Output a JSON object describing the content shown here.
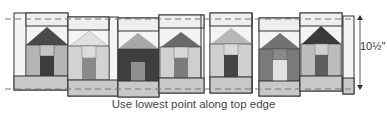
{
  "caption": "Use lowest point along top edge",
  "dimension": {
    "label": "10½\""
  },
  "colors": {
    "outline": "#333333",
    "sky": "#f4f4f4",
    "band": "#dcdcdc",
    "bottom": "#c8c8c8",
    "dash": "#777777"
  },
  "houses": [
    {
      "roof": "#4a4a4a",
      "body": "#b4b4b4",
      "door": "#3c3c3c"
    },
    {
      "roof": "#e0e0e0",
      "body": "#d2d2d2",
      "door": "#8a8a8a"
    },
    {
      "roof": "#a8a8a8",
      "body": "#3e3e3e",
      "door": "#8e8e8e"
    },
    {
      "roof": "#6a6a6a",
      "body": "#cfcfcf",
      "door": "#7c7c7c"
    },
    {
      "roof": "#b8b8b8",
      "body": "#d0d0d0",
      "door": "#444444"
    },
    {
      "roof": "#727272",
      "body": "#7a7a7a",
      "door": "#e0e0e0"
    },
    {
      "roof": "#3a3a3a",
      "body": "#bcbcbc",
      "door": "#5e5e5e"
    }
  ]
}
